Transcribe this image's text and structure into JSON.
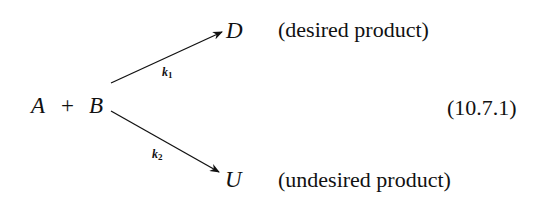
{
  "equation": {
    "reactant_a": "A",
    "plus": "+",
    "reactant_b": "B",
    "product_desired": "D",
    "product_undesired": "U",
    "rate_1": {
      "symbol": "k",
      "subscript": "1"
    },
    "rate_2": {
      "symbol": "k",
      "subscript": "2"
    },
    "desired_label": "(desired product)",
    "undesired_label": "(undesired product)",
    "equation_number": "(10.7.1)"
  }
}
